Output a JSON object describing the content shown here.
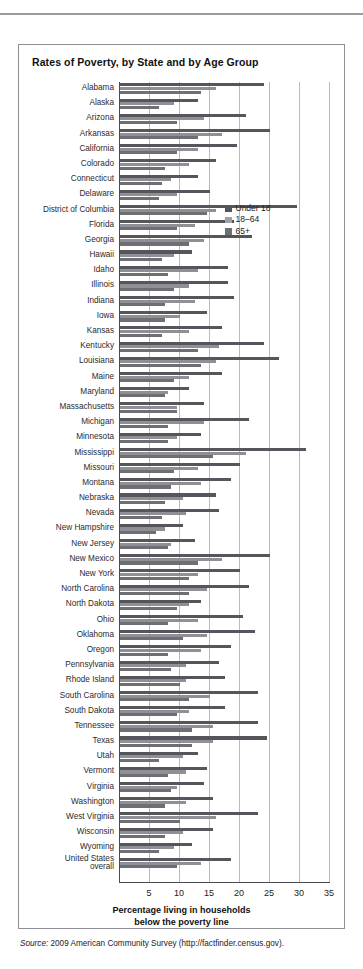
{
  "page": {
    "top_ghost_text": "",
    "source_prefix": "Source:",
    "source_text": " 2009 American Community Survey (http://factfinder.census.gov)."
  },
  "figure": {
    "title": "Rates of Poverty, by State and by Age Group",
    "axis_caption_line1": "Percentage living in households",
    "axis_caption_line2": "below the poverty line"
  },
  "legend": {
    "items": [
      {
        "label": "Under 18",
        "color": "#55555b"
      },
      {
        "label": "18–64",
        "color": "#a0a0a7"
      },
      {
        "label": "65+",
        "color": "#6e6e75"
      }
    ]
  },
  "chart_data": {
    "type": "bar",
    "orientation": "horizontal",
    "title": "Rates of Poverty, by State and by Age Group",
    "xlabel": "Percentage living in households below the poverty line",
    "ylabel": "",
    "xlim": [
      0,
      35
    ],
    "xticks": [
      5,
      10,
      15,
      20,
      25,
      30,
      35
    ],
    "grid": true,
    "legend_position": "upper-right-inside",
    "series": [
      {
        "name": "Under 18",
        "color": "#55555b"
      },
      {
        "name": "18–64",
        "color": "#a0a0a7"
      },
      {
        "name": "65+",
        "color": "#6e6e75"
      }
    ],
    "categories": [
      "Alabama",
      "Alaska",
      "Arizona",
      "Arkansas",
      "California",
      "Colorado",
      "Connecticut",
      "Delaware",
      "District of Columbia",
      "Florida",
      "Georgia",
      "Hawaii",
      "Idaho",
      "Illinois",
      "Indiana",
      "Iowa",
      "Kansas",
      "Kentucky",
      "Louisiana",
      "Maine",
      "Maryland",
      "Massachusetts",
      "Michigan",
      "Minnesota",
      "Mississippi",
      "Missouri",
      "Montana",
      "Nebraska",
      "Nevada",
      "New Hampshire",
      "New Jersey",
      "New Mexico",
      "New York",
      "North Carolina",
      "North Dakota",
      "Ohio",
      "Oklahoma",
      "Oregon",
      "Pennsylvania",
      "Rhode Island",
      "South Carolina",
      "South Dakota",
      "Tennessee",
      "Texas",
      "Utah",
      "Vermont",
      "Virginia",
      "Washington",
      "West Virginia",
      "Wisconsin",
      "Wyoming",
      "United States overall"
    ],
    "rows": [
      {
        "label": "Alabama",
        "values": [
          24.0,
          16.0,
          13.5
        ]
      },
      {
        "label": "Alaska",
        "values": [
          13.0,
          9.0,
          6.5
        ]
      },
      {
        "label": "Arizona",
        "values": [
          21.0,
          14.0,
          9.5
        ]
      },
      {
        "label": "Arkansas",
        "values": [
          25.0,
          17.0,
          13.0
        ]
      },
      {
        "label": "California",
        "values": [
          19.5,
          13.0,
          9.5
        ]
      },
      {
        "label": "Colorado",
        "values": [
          16.0,
          11.5,
          7.5
        ]
      },
      {
        "label": "Connecticut",
        "values": [
          13.0,
          8.5,
          7.0
        ]
      },
      {
        "label": "Delaware",
        "values": [
          15.0,
          9.5,
          6.5
        ]
      },
      {
        "label": "District of Columbia",
        "values": [
          29.5,
          16.0,
          14.5
        ]
      },
      {
        "label": "Florida",
        "values": [
          19.0,
          12.5,
          9.5
        ]
      },
      {
        "label": "Georgia",
        "values": [
          22.0,
          14.0,
          11.5
        ]
      },
      {
        "label": "Hawaii",
        "values": [
          12.0,
          9.0,
          7.0
        ]
      },
      {
        "label": "Idaho",
        "values": [
          18.0,
          13.0,
          8.0
        ]
      },
      {
        "label": "Illinois",
        "values": [
          18.0,
          11.5,
          9.0
        ]
      },
      {
        "label": "Indiana",
        "values": [
          19.0,
          12.5,
          7.5
        ]
      },
      {
        "label": "Iowa",
        "values": [
          14.5,
          10.0,
          7.5
        ]
      },
      {
        "label": "Kansas",
        "values": [
          17.0,
          11.5,
          7.0
        ]
      },
      {
        "label": "Kentucky",
        "values": [
          24.0,
          16.5,
          13.0
        ]
      },
      {
        "label": "Louisiana",
        "values": [
          26.5,
          16.0,
          13.5
        ]
      },
      {
        "label": "Maine",
        "values": [
          17.0,
          11.5,
          9.0
        ]
      },
      {
        "label": "Maryland",
        "values": [
          11.5,
          8.0,
          7.5
        ]
      },
      {
        "label": "Massachusetts",
        "values": [
          14.0,
          9.5,
          9.5
        ]
      },
      {
        "label": "Michigan",
        "values": [
          21.5,
          14.0,
          8.0
        ]
      },
      {
        "label": "Minnesota",
        "values": [
          13.5,
          9.5,
          8.0
        ]
      },
      {
        "label": "Mississippi",
        "values": [
          31.0,
          21.0,
          15.5
        ]
      },
      {
        "label": "Missouri",
        "values": [
          20.0,
          13.0,
          9.0
        ]
      },
      {
        "label": "Montana",
        "values": [
          18.5,
          13.5,
          8.5
        ]
      },
      {
        "label": "Nebraska",
        "values": [
          16.0,
          10.5,
          7.5
        ]
      },
      {
        "label": "Nevada",
        "values": [
          16.5,
          11.0,
          7.0
        ]
      },
      {
        "label": "New Hampshire",
        "values": [
          10.5,
          7.5,
          6.0
        ]
      },
      {
        "label": "New Jersey",
        "values": [
          12.5,
          8.5,
          8.0
        ]
      },
      {
        "label": "New Mexico",
        "values": [
          25.0,
          17.0,
          13.0
        ]
      },
      {
        "label": "New York",
        "values": [
          20.0,
          13.0,
          11.5
        ]
      },
      {
        "label": "North Carolina",
        "values": [
          21.5,
          14.5,
          11.5
        ]
      },
      {
        "label": "North Dakota",
        "values": [
          13.5,
          11.5,
          9.5
        ]
      },
      {
        "label": "Ohio",
        "values": [
          20.5,
          13.0,
          8.0
        ]
      },
      {
        "label": "Oklahoma",
        "values": [
          22.5,
          14.5,
          10.5
        ]
      },
      {
        "label": "Oregon",
        "values": [
          18.5,
          13.5,
          8.0
        ]
      },
      {
        "label": "Pennsylvania",
        "values": [
          16.5,
          11.0,
          8.5
        ]
      },
      {
        "label": "Rhode Island",
        "values": [
          17.5,
          11.0,
          10.0
        ]
      },
      {
        "label": "South Carolina",
        "values": [
          23.0,
          15.0,
          11.5
        ]
      },
      {
        "label": "South Dakota",
        "values": [
          17.5,
          11.5,
          9.5
        ]
      },
      {
        "label": "Tennessee",
        "values": [
          23.0,
          15.5,
          12.0
        ]
      },
      {
        "label": "Texas",
        "values": [
          24.5,
          15.5,
          12.0
        ]
      },
      {
        "label": "Utah",
        "values": [
          13.0,
          10.5,
          6.5
        ]
      },
      {
        "label": "Vermont",
        "values": [
          14.5,
          11.0,
          8.0
        ]
      },
      {
        "label": "Virginia",
        "values": [
          14.0,
          9.5,
          8.5
        ]
      },
      {
        "label": "Washington",
        "values": [
          15.5,
          11.0,
          7.5
        ]
      },
      {
        "label": "West Virginia",
        "values": [
          23.0,
          16.0,
          10.0
        ]
      },
      {
        "label": "Wisconsin",
        "values": [
          15.5,
          10.5,
          7.5
        ]
      },
      {
        "label": "Wyoming",
        "values": [
          12.0,
          9.0,
          6.5
        ]
      },
      {
        "label": "United States overall",
        "values": [
          18.5,
          13.5,
          9.5
        ]
      }
    ]
  }
}
